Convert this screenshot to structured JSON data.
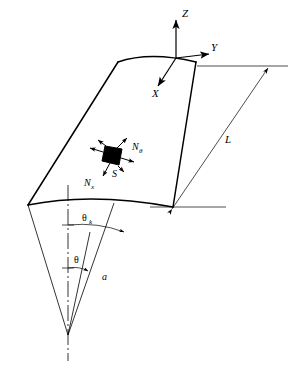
{
  "figure": {
    "background_color": "#ffffff",
    "line_color": "#000000",
    "element_fill_color": "#000000",
    "thin_line_color": "#555555"
  },
  "axes": {
    "z_label": "Z",
    "y_label": "Y",
    "x_label": "X",
    "origin_note": "axes origin at mid of top arc"
  },
  "stress_resultants": {
    "n_theta_label": "N",
    "n_theta_sub": "θ",
    "n_x_label": "N",
    "n_x_sub": "x",
    "shear_label": "S"
  },
  "geometry_labels": {
    "length_label": "L",
    "radius_label": "a",
    "theta_label": "θ",
    "theta_k_label": "θ",
    "theta_k_sub": "k"
  }
}
